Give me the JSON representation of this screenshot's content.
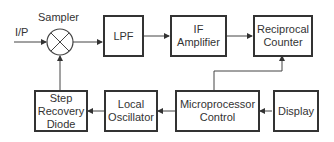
{
  "diagram": {
    "input_label": "I/P",
    "sampler_label": "Sampler",
    "blocks": {
      "lpf": "LPF",
      "if_amp_line1": "IF",
      "if_amp_line2": "Amplifier",
      "counter_line1": "Reciprocal",
      "counter_line2": "Counter",
      "srd_line1": "Step",
      "srd_line2": "Recovery",
      "srd_line3": "Diode",
      "lo_line1": "Local",
      "lo_line2": "Oscillator",
      "mpc_line1": "Microprocessor",
      "mpc_line2": "Control",
      "display": "Display"
    },
    "colors": {
      "stroke": "#333333",
      "background": "#ffffff"
    }
  }
}
